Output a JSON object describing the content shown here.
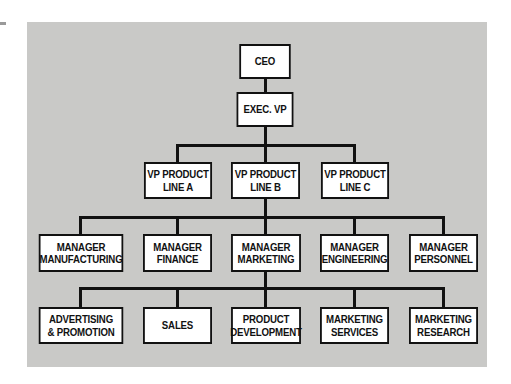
{
  "chart": {
    "levels": [
      {
        "level": 1,
        "nodes": [
          {
            "id": "ceo",
            "label": "CEO"
          }
        ]
      },
      {
        "level": 2,
        "nodes": [
          {
            "id": "exec_vp",
            "label": "EXEC. VP"
          }
        ]
      },
      {
        "level": 3,
        "nodes": [
          {
            "id": "vp_a",
            "label": "VP PRODUCT\nLINE A"
          },
          {
            "id": "vp_b",
            "label": "VP PRODUCT\nLINE B"
          },
          {
            "id": "vp_c",
            "label": "VP PRODUCT\nLINE C"
          }
        ]
      },
      {
        "level": 4,
        "nodes": [
          {
            "id": "mgr_mfg",
            "label": "MANAGER\nMANUFACTURING"
          },
          {
            "id": "mgr_fin",
            "label": "MANAGER\nFINANCE"
          },
          {
            "id": "mgr_mkt",
            "label": "MANAGER\nMARKETING"
          },
          {
            "id": "mgr_eng",
            "label": "MANAGER\nENGINEERING"
          },
          {
            "id": "mgr_per",
            "label": "MANAGER\nPERSONNEL"
          }
        ]
      },
      {
        "level": 5,
        "nodes": [
          {
            "id": "adv",
            "label": "ADVERTISING\n& PROMOTION"
          },
          {
            "id": "sales",
            "label": "SALES"
          },
          {
            "id": "pd",
            "label": "PRODUCT\nDEVELOPMENT"
          },
          {
            "id": "ms",
            "label": "MARKETING\nSERVICES"
          },
          {
            "id": "mr",
            "label": "MARKETING\nRESEARCH"
          }
        ]
      }
    ],
    "edges": [
      [
        "ceo",
        "exec_vp"
      ],
      [
        "exec_vp",
        "vp_a"
      ],
      [
        "exec_vp",
        "vp_b"
      ],
      [
        "exec_vp",
        "vp_c"
      ],
      [
        "vp_b",
        "mgr_mfg"
      ],
      [
        "vp_b",
        "mgr_fin"
      ],
      [
        "vp_b",
        "mgr_mkt"
      ],
      [
        "vp_b",
        "mgr_eng"
      ],
      [
        "vp_b",
        "mgr_per"
      ],
      [
        "mgr_mkt",
        "adv"
      ],
      [
        "mgr_mkt",
        "sales"
      ],
      [
        "mgr_mkt",
        "pd"
      ],
      [
        "mgr_mkt",
        "ms"
      ],
      [
        "mgr_mkt",
        "mr"
      ]
    ]
  },
  "colors": {
    "panel": "#c9c9c7",
    "box": "#ffffff",
    "line": "#111111"
  }
}
